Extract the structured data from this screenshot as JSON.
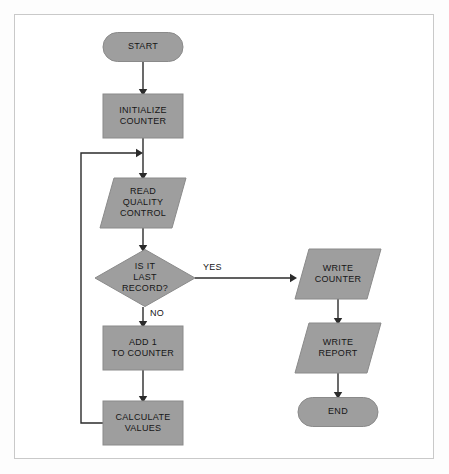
{
  "diagram": {
    "type": "flowchart",
    "background_color": "#ffffff",
    "frame_border_color": "#c9c9c9",
    "node_fill_color": "#9e9e9e",
    "node_stroke_color": "#8a8a8a",
    "line_color": "#2b2b2b",
    "text_color": "#161616",
    "nodes": [
      {
        "id": "start",
        "shape": "terminator",
        "lines": [
          "START"
        ],
        "x": 143,
        "y": 47,
        "w": 80,
        "h": 29
      },
      {
        "id": "initialize_counter",
        "shape": "process",
        "lines": [
          "INITIALIZE",
          "COUNTER"
        ],
        "x": 143,
        "y": 116,
        "w": 80,
        "h": 44
      },
      {
        "id": "read_quality_control",
        "shape": "parallelogram",
        "lines": [
          "READ",
          "QUALITY",
          "CONTROL"
        ],
        "x": 143,
        "y": 203,
        "w": 86,
        "h": 50
      },
      {
        "id": "is_it_last_record",
        "shape": "decision",
        "lines": [
          "IS IT",
          "LAST",
          "RECORD?"
        ],
        "x": 145,
        "y": 278,
        "w": 100,
        "h": 57
      },
      {
        "id": "add_1_to_counter",
        "shape": "process",
        "lines": [
          "ADD 1",
          "TO COUNTER"
        ],
        "x": 143,
        "y": 348,
        "w": 80,
        "h": 44
      },
      {
        "id": "calculate_values",
        "shape": "process",
        "lines": [
          "CALCULATE",
          "VALUES"
        ],
        "x": 143,
        "y": 423,
        "w": 80,
        "h": 44
      },
      {
        "id": "write_counter",
        "shape": "parallelogram",
        "lines": [
          "WRITE",
          "COUNTER"
        ],
        "x": 338,
        "y": 274,
        "w": 86,
        "h": 50
      },
      {
        "id": "write_report",
        "shape": "parallelogram",
        "lines": [
          "WRITE",
          "REPORT"
        ],
        "x": 338,
        "y": 348,
        "w": 86,
        "h": 50
      },
      {
        "id": "end",
        "shape": "terminator",
        "lines": [
          "END"
        ],
        "x": 338,
        "y": 412,
        "w": 80,
        "h": 29
      }
    ],
    "edges": [
      {
        "id": "start-to-initialize",
        "from": "start",
        "to": "initialize_counter",
        "points": "143,62 143,92",
        "arrow": {
          "x": 143,
          "y": 94,
          "dir": "down"
        },
        "label": ""
      },
      {
        "id": "initialize-to-read",
        "from": "initialize_counter",
        "to": "read_quality_control",
        "points": "143,138 143,176",
        "arrow": {
          "x": 143,
          "y": 178,
          "dir": "down"
        },
        "label": ""
      },
      {
        "id": "read-to-decision",
        "from": "read_quality_control",
        "to": "is_it_last_record",
        "points": "143,228 143,248",
        "arrow": {
          "x": 143,
          "y": 250,
          "dir": "down"
        },
        "label": ""
      },
      {
        "id": "decision-yes-to-write-counter",
        "from": "is_it_last_record",
        "to": "write_counter",
        "points": "195,278 293,278",
        "arrow": {
          "x": 295,
          "y": 278,
          "dir": "right"
        },
        "label": "YES",
        "label_x": 203,
        "label_y": 270
      },
      {
        "id": "decision-no-to-add",
        "from": "is_it_last_record",
        "to": "add_1_to_counter",
        "points": "143,307 143,324",
        "arrow": {
          "x": 143,
          "y": 326,
          "dir": "down"
        },
        "label": "NO",
        "label_x": 150,
        "label_y": 316
      },
      {
        "id": "add-to-calculate",
        "from": "add_1_to_counter",
        "to": "calculate_values",
        "points": "143,370 143,399",
        "arrow": {
          "x": 143,
          "y": 401,
          "dir": "down"
        },
        "label": ""
      },
      {
        "id": "calculate-loop-back-to-read",
        "from": "calculate_values",
        "to": "read_quality_control",
        "points": "103,423 81,423 81,153 138,153",
        "arrow": {
          "x": 141,
          "y": 153,
          "dir": "right"
        },
        "label": ""
      },
      {
        "id": "write-counter-to-write-report",
        "from": "write_counter",
        "to": "write_report",
        "points": "338,299 338,321",
        "arrow": {
          "x": 338,
          "y": 323,
          "dir": "down"
        },
        "label": ""
      },
      {
        "id": "write-report-to-end",
        "from": "write_report",
        "to": "end",
        "points": "338,373 338,395",
        "arrow": {
          "x": 338,
          "y": 397,
          "dir": "down"
        },
        "label": ""
      }
    ]
  }
}
